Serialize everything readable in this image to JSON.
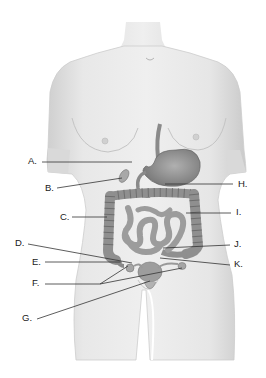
{
  "diagram": {
    "labels": [
      {
        "id": "A",
        "text": "A.",
        "x": 28,
        "y": 156,
        "line": [
          [
            42,
            162
          ],
          [
            132,
            162
          ]
        ]
      },
      {
        "id": "B",
        "text": "B.",
        "x": 45,
        "y": 183,
        "line": [
          [
            57,
            188
          ],
          [
            122,
            178
          ]
        ]
      },
      {
        "id": "C",
        "text": "C.",
        "x": 60,
        "y": 212,
        "line": [
          [
            72,
            217
          ],
          [
            107,
            217
          ]
        ]
      },
      {
        "id": "D",
        "text": "D.",
        "x": 15,
        "y": 238,
        "line": [
          [
            28,
            244
          ],
          [
            132,
            263
          ]
        ]
      },
      {
        "id": "E",
        "text": "E.",
        "x": 32,
        "y": 257,
        "line": [
          [
            45,
            262
          ],
          [
            122,
            262
          ]
        ]
      },
      {
        "id": "F",
        "text": "F.",
        "x": 32,
        "y": 278,
        "line": [
          [
            45,
            284
          ],
          [
            100,
            284
          ]
        ]
      },
      {
        "id": "G",
        "text": "G.",
        "x": 22,
        "y": 313,
        "line": [
          [
            37,
            319
          ],
          [
            150,
            281
          ]
        ]
      },
      {
        "id": "H",
        "text": "H.",
        "x": 238,
        "y": 179,
        "line": [
          [
            165,
            184
          ],
          [
            233,
            184
          ]
        ]
      },
      {
        "id": "I",
        "text": "I.",
        "x": 236,
        "y": 207,
        "line": [
          [
            186,
            213
          ],
          [
            231,
            213
          ]
        ]
      },
      {
        "id": "J",
        "text": "J.",
        "x": 234,
        "y": 239,
        "line": [
          [
            163,
            248
          ],
          [
            230,
            245
          ]
        ]
      },
      {
        "id": "K",
        "text": "K.",
        "x": 234,
        "y": 259,
        "line": [
          [
            160,
            258
          ],
          [
            230,
            265
          ]
        ]
      }
    ],
    "extra_leader_lines": [
      {
        "for": "F",
        "line": [
          [
            100,
            284
          ],
          [
            128,
            266
          ]
        ]
      },
      {
        "for": "F",
        "line": [
          [
            100,
            284
          ],
          [
            182,
            268
          ]
        ]
      }
    ],
    "colors": {
      "skin": "#e6e6e6",
      "skin_shadow": "#c9c9c9",
      "organ": "#9a9a9a",
      "organ_dark": "#6f6f6f",
      "line": "#333333"
    }
  }
}
